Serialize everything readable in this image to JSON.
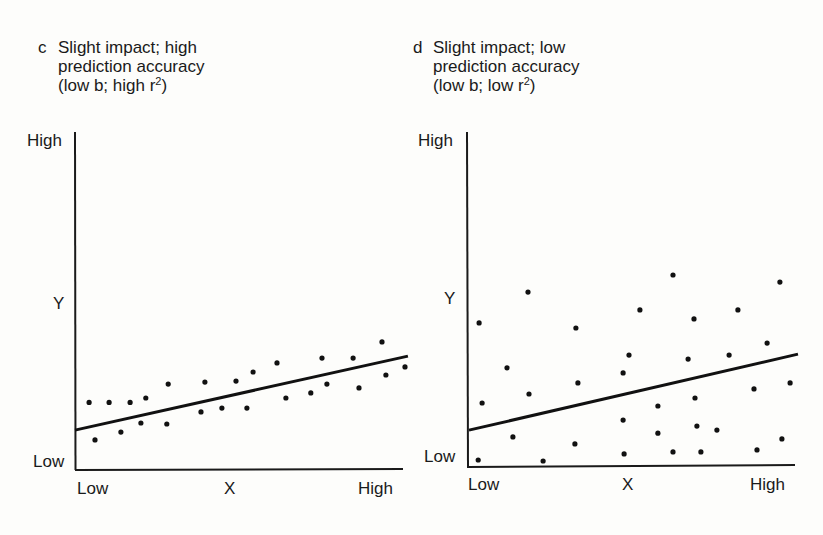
{
  "panels": [
    {
      "letter": "c",
      "title_lines": [
        "Slight impact; high",
        "prediction accuracy",
        "(low b; high r"
      ],
      "title_suffix": ")",
      "y_axis": {
        "label": "Y",
        "high": "High",
        "low": "Low"
      },
      "x_axis": {
        "label": "X",
        "low": "Low",
        "high": "High"
      }
    },
    {
      "letter": "d",
      "title_lines": [
        "Slight impact; low",
        "prediction accuracy",
        "(low b; low r"
      ],
      "title_suffix": ")",
      "y_axis": {
        "label": "Y",
        "high": "High",
        "low": "Low"
      },
      "x_axis": {
        "label": "X",
        "low": "Low",
        "high": "High"
      }
    }
  ],
  "superscript": "2",
  "chart_data": [
    {
      "type": "scatter",
      "title": "c Slight impact; high prediction accuracy (low b; high r²)",
      "xlabel": "X",
      "ylabel": "Y",
      "x_ticks": [
        "Low",
        "High"
      ],
      "y_ticks": [
        "Low",
        "High"
      ],
      "xlim": [
        0,
        10
      ],
      "ylim": [
        0,
        10
      ],
      "grid": false,
      "points": [
        [
          0.43,
          2.0
        ],
        [
          1.04,
          2.0
        ],
        [
          1.68,
          2.0
        ],
        [
          2.16,
          2.13
        ],
        [
          2.84,
          2.54
        ],
        [
          0.61,
          0.89
        ],
        [
          1.4,
          1.12
        ],
        [
          2.01,
          1.39
        ],
        [
          2.8,
          1.36
        ],
        [
          3.96,
          2.6
        ],
        [
          3.84,
          1.72
        ],
        [
          4.48,
          1.83
        ],
        [
          4.91,
          2.63
        ],
        [
          5.24,
          1.83
        ],
        [
          5.43,
          2.9
        ],
        [
          6.16,
          3.17
        ],
        [
          6.43,
          2.13
        ],
        [
          7.19,
          2.28
        ],
        [
          7.53,
          3.31
        ],
        [
          7.68,
          2.54
        ],
        [
          8.48,
          3.31
        ],
        [
          8.66,
          2.43
        ],
        [
          9.36,
          3.79
        ],
        [
          9.48,
          2.81
        ],
        [
          10.06,
          3.05
        ]
      ],
      "regression_line": {
        "x": [
          0,
          10.15
        ],
        "y": [
          1.18,
          3.37
        ]
      }
    },
    {
      "type": "scatter",
      "title": "d Slight impact; low prediction accuracy (low b; low r²)",
      "xlabel": "X",
      "ylabel": "Y",
      "x_ticks": [
        "Low",
        "High"
      ],
      "y_ticks": [
        "Low",
        "High"
      ],
      "xlim": [
        0,
        10
      ],
      "ylim": [
        0,
        10
      ],
      "grid": false,
      "points": [
        [
          0.37,
          4.3
        ],
        [
          1.86,
          5.22
        ],
        [
          3.32,
          4.15
        ],
        [
          5.27,
          4.69
        ],
        [
          6.28,
          5.73
        ],
        [
          6.92,
          4.42
        ],
        [
          8.26,
          4.69
        ],
        [
          9.54,
          5.52
        ],
        [
          1.22,
          2.96
        ],
        [
          4.94,
          3.34
        ],
        [
          4.76,
          2.81
        ],
        [
          6.74,
          3.22
        ],
        [
          7.99,
          3.34
        ],
        [
          9.15,
          3.7
        ],
        [
          3.38,
          2.51
        ],
        [
          0.46,
          1.91
        ],
        [
          1.89,
          2.18
        ],
        [
          9.85,
          2.51
        ],
        [
          8.75,
          2.33
        ],
        [
          5.82,
          1.82
        ],
        [
          6.95,
          2.06
        ],
        [
          4.76,
          1.4
        ],
        [
          5.82,
          1.01
        ],
        [
          7.01,
          1.22
        ],
        [
          7.62,
          1.1
        ],
        [
          1.4,
          0.9
        ],
        [
          3.29,
          0.69
        ],
        [
          9.6,
          0.84
        ],
        [
          0.34,
          0.21
        ],
        [
          2.32,
          0.18
        ],
        [
          4.79,
          0.39
        ],
        [
          6.28,
          0.45
        ],
        [
          7.13,
          0.45
        ],
        [
          8.84,
          0.51
        ]
      ],
      "regression_line": {
        "x": [
          0.06,
          10.09
        ],
        "y": [
          1.1,
          3.37
        ]
      }
    }
  ]
}
